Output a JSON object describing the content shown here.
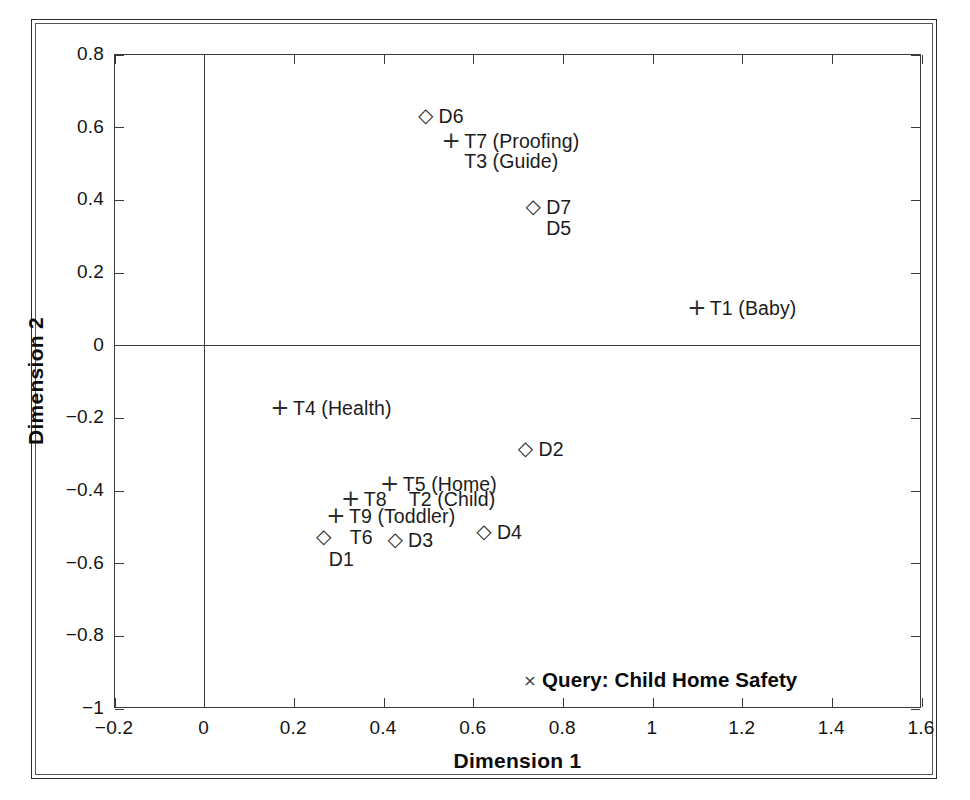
{
  "chart_data": {
    "type": "scatter",
    "title": "",
    "xlabel": "Dimension 1",
    "ylabel": "Dimension 2",
    "xlim": [
      -0.2,
      1.6
    ],
    "ylim": [
      -1,
      0.8
    ],
    "xticks": [
      "-0.2",
      "0",
      "0.2",
      "0.4",
      "0.6",
      "0.8",
      "1",
      "1.2",
      "1.4",
      "1.6"
    ],
    "xtick_values": [
      -0.2,
      0,
      0.2,
      0.4,
      0.6,
      0.8,
      1.0,
      1.2,
      1.4,
      1.6
    ],
    "yticks": [
      "0.8",
      "0.6",
      "0.4",
      "0.2",
      "0",
      "-0.2",
      "-0.4",
      "-0.6",
      "-0.8",
      "-1"
    ],
    "ytick_values": [
      0.8,
      0.6,
      0.4,
      0.2,
      0,
      -0.2,
      -0.4,
      -0.6,
      -0.8,
      -1.0
    ],
    "grid": false,
    "legend": false,
    "zero_lines": {
      "x": 0,
      "y": 0
    },
    "series": [
      {
        "name": "Documents",
        "marker": "diamond",
        "points": [
          {
            "label": "D6",
            "x": 0.495,
            "y": 0.633,
            "label_dx": 13,
            "label_dy": -10
          },
          {
            "label": "D7",
            "x": 0.735,
            "y": 0.381,
            "label_dx": 13,
            "label_dy": -10
          },
          {
            "label": "D5",
            "x": 0.735,
            "y": 0.325,
            "label_dx": 13,
            "label_dy": -10,
            "marker_hidden": true
          },
          {
            "label": "D2",
            "x": 0.718,
            "y": -0.285,
            "label_dx": 13,
            "label_dy": -10
          },
          {
            "label": "D4",
            "x": 0.625,
            "y": -0.512,
            "label_dx": 13,
            "label_dy": -10
          },
          {
            "label": "D3",
            "x": 0.427,
            "y": -0.534,
            "label_dx": 13,
            "label_dy": -10
          },
          {
            "label": "D1",
            "x": 0.268,
            "y": -0.527,
            "label_dx": 5,
            "label_dy": 12
          },
          {
            "label": "T6",
            "x": 0.268,
            "y": -0.527,
            "label_dx": 26,
            "label_dy": -10,
            "marker_hidden": true
          }
        ]
      },
      {
        "name": "Terms",
        "marker": "plus",
        "points": [
          {
            "label": "T7 (Proofing)",
            "x": 0.552,
            "y": 0.564,
            "label_dx": 13,
            "label_dy": -10
          },
          {
            "label": "T3 (Guide)",
            "x": 0.552,
            "y": 0.509,
            "label_dx": 13,
            "label_dy": -10,
            "marker_hidden": true
          },
          {
            "label": "T1 (Baby)",
            "x": 1.1,
            "y": 0.105,
            "label_dx": 13,
            "label_dy": -10
          },
          {
            "label": "T4 (Health)",
            "x": 0.17,
            "y": -0.172,
            "label_dx": 13,
            "label_dy": -10
          },
          {
            "label": "T5 (Home)",
            "x": 0.415,
            "y": -0.381,
            "label_dx": 13,
            "label_dy": -10
          },
          {
            "label": "T8",
            "x": 0.328,
            "y": -0.423,
            "label_dx": 13,
            "label_dy": -10
          },
          {
            "label": "T2 (Child)",
            "x": 0.328,
            "y": -0.423,
            "label_dx": 58,
            "label_dy": -10,
            "marker_hidden": true
          },
          {
            "label": "T9 (Toddler)",
            "x": 0.295,
            "y": -0.47,
            "label_dx": 13,
            "label_dy": -10
          }
        ]
      },
      {
        "name": "Query",
        "marker": "cross",
        "points": [
          {
            "label": "Query: Child Home Safety",
            "x": 0.728,
            "y": -0.927,
            "label_dx": 12,
            "label_dy": -13,
            "bold": true
          }
        ]
      }
    ]
  }
}
